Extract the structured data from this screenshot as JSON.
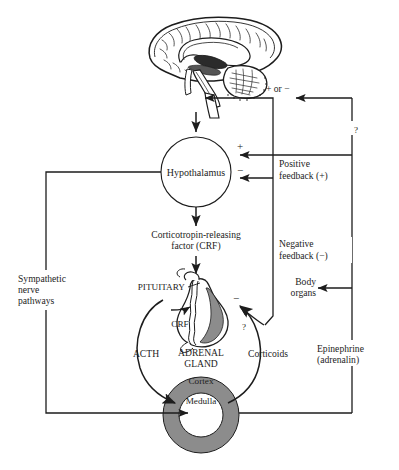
{
  "figure": {
    "type": "biological-flow-diagram",
    "background_color": "#ffffff",
    "ink_color": "#1d1d1d",
    "shading_color": "#8c8c8c"
  },
  "nodes": {
    "brain": {
      "name": "brain-illustration",
      "label": ""
    },
    "hypothalamus": {
      "label": "Hypothalamus"
    },
    "crf_message": {
      "line1": "Corticotropin-releasing",
      "line2": "factor (CRF)"
    },
    "pituitary": {
      "label": "PITUITARY",
      "inner_label": "CRF"
    },
    "adrenal": {
      "line1": "ADRENAL",
      "line2": "GLAND",
      "cortex": "Cortex",
      "medulla": "Medulla"
    },
    "body_organs": {
      "line1": "Body",
      "line2": "organs"
    }
  },
  "pathways": {
    "acth": "ACTH",
    "corticoids": "Corticoids",
    "epinephrine": {
      "line1": "Epinephrine",
      "line2": "(adrenalin)"
    },
    "sympathetic": {
      "line1": "Sympathetic",
      "line2": "nerve",
      "line3": "pathways"
    },
    "positive_feedback": {
      "line1": "Positive",
      "line2": "feedback (+)"
    },
    "negative_feedback": {
      "line1": "Negative",
      "line2": "feedback (−)"
    }
  },
  "signs": {
    "plus_or_minus": "+ or −",
    "plus": "+",
    "minus": "−",
    "minus_pituitary": "−",
    "question_right": "?",
    "question_pituitary": "?"
  }
}
